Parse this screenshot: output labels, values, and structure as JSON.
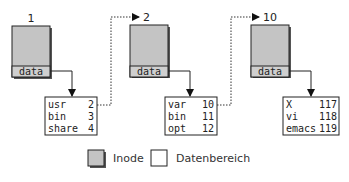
{
  "diagram": {
    "inodes": [
      {
        "number": "1",
        "field_label": "data",
        "directory_entries": [
          {
            "name": "usr",
            "inode": "2"
          },
          {
            "name": "bin",
            "inode": "3"
          },
          {
            "name": "share",
            "inode": "4"
          }
        ]
      },
      {
        "number": "2",
        "field_label": "data",
        "directory_entries": [
          {
            "name": "var",
            "inode": "10"
          },
          {
            "name": "bin",
            "inode": "11"
          },
          {
            "name": "opt",
            "inode": "12"
          }
        ]
      },
      {
        "number": "10",
        "field_label": "data",
        "directory_entries": [
          {
            "name": "X",
            "inode": "117"
          },
          {
            "name": "vi",
            "inode": "118"
          },
          {
            "name": "emacs",
            "inode": "119"
          }
        ]
      }
    ],
    "links": [
      {
        "from_entry": "usr",
        "to_inode": "2"
      },
      {
        "from_entry": "var",
        "to_inode": "10"
      }
    ],
    "legend": {
      "inode_label": "Inode",
      "data_area_label": "Datenbereich"
    },
    "colors": {
      "inode_fill": "#c4c4c4",
      "data_row_fill": "#cfcfcf",
      "shadow": "#555555",
      "stroke": "#222222"
    }
  }
}
